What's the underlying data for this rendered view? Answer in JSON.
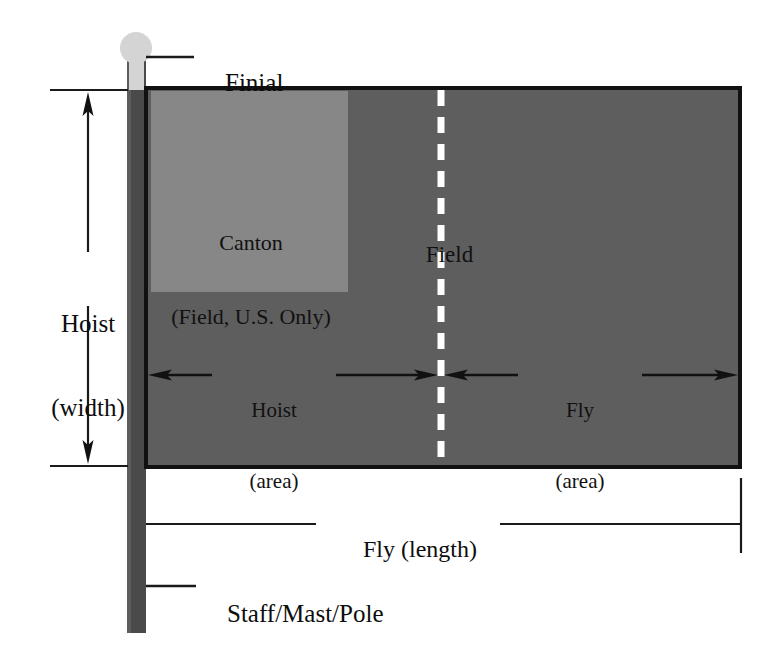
{
  "diagram": {
    "labels": {
      "finial": "Finial",
      "hoist_width_line1": "Hoist",
      "hoist_width_line2": "(width)",
      "canton_line1": "Canton",
      "canton_line2": "(Field, U.S. Only)",
      "field": "Field",
      "hoist_area_line1": "Hoist",
      "hoist_area_line2": "(area)",
      "fly_area_line1": "Fly",
      "fly_area_line2": "(area)",
      "fly_length": "Fly (length)",
      "staff": "Staff/Mast/Pole"
    },
    "colors": {
      "background": "#ffffff",
      "field": "#5e5e5e",
      "canton": "#878787",
      "staff": "#4a4a4a",
      "finial": "#d4d4d4",
      "border": "#111111",
      "centerline": "#ffffff",
      "leader": "#1a1a1a"
    },
    "geometry": {
      "flag_left": 146,
      "flag_top": 88,
      "flag_right": 740,
      "flag_bottom": 467,
      "canton_left": 152,
      "canton_top": 92,
      "canton_right": 348,
      "canton_bottom": 292,
      "staff_left": 127,
      "staff_right": 146,
      "staff_top": 60,
      "staff_bottom": 633,
      "finial_cx": 136,
      "finial_cy": 48,
      "finial_r": 16,
      "centerline_x": 441
    }
  }
}
